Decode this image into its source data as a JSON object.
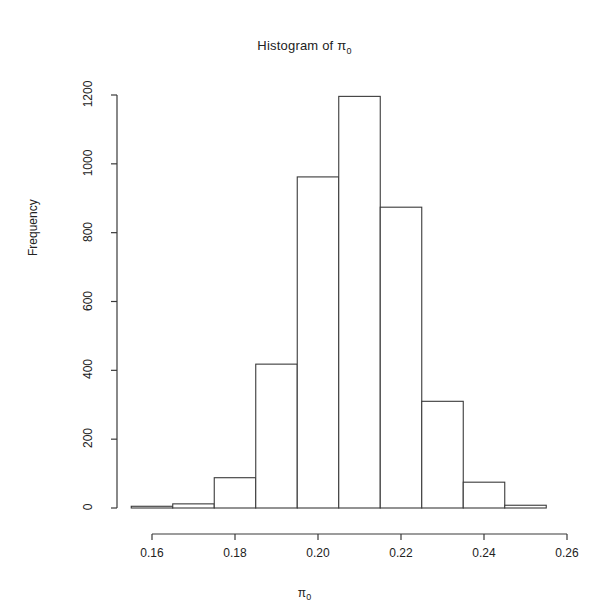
{
  "chart_data": {
    "type": "bar",
    "title_main": "Histogram of ",
    "title_sym": "π",
    "title_sub": "0",
    "xlabel": "π₀",
    "xlabel_sym": "π",
    "xlabel_sub": "0",
    "ylabel": "Frequency",
    "grid": false,
    "legend": "none",
    "xlim": [
      0.155,
      0.26
    ],
    "ylim": [
      0,
      1200
    ],
    "xticks": [
      0.16,
      0.18,
      0.2,
      0.22,
      0.24,
      0.26
    ],
    "xtick_labels": [
      "0.16",
      "0.18",
      "0.20",
      "0.22",
      "0.24",
      "0.26"
    ],
    "yticks": [
      0,
      200,
      400,
      600,
      800,
      1000,
      1200
    ],
    "ytick_labels": [
      "0",
      "200",
      "400",
      "600",
      "800",
      "1000",
      "1200"
    ],
    "bin_width": 0.01,
    "bin_edges": [
      0.155,
      0.165,
      0.175,
      0.185,
      0.195,
      0.205,
      0.215,
      0.225,
      0.235,
      0.245,
      0.255
    ],
    "categories": [
      "0.155-0.165",
      "0.165-0.175",
      "0.175-0.185",
      "0.185-0.195",
      "0.195-0.205",
      "0.205-0.215",
      "0.215-0.225",
      "0.225-0.235",
      "0.235-0.245",
      "0.245-0.255"
    ],
    "values": [
      5,
      12,
      88,
      418,
      962,
      1196,
      874,
      310,
      75,
      8
    ],
    "bar_fill": "#ffffff",
    "bar_stroke": "#3a3a3a",
    "axis_color": "#3a3a3a"
  }
}
